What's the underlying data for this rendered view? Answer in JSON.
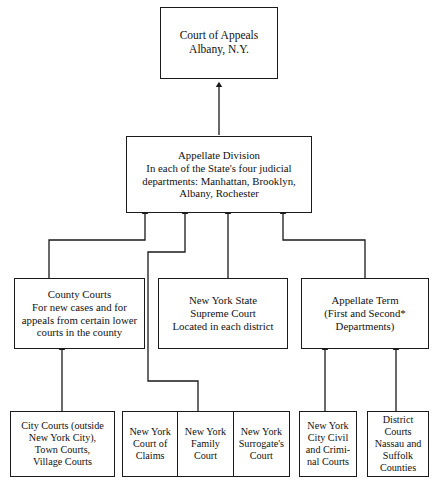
{
  "diagram": {
    "line_color": "#1a1a1a",
    "background": "#ffffff",
    "nodes": {
      "court_of_appeals": "Court of Appeals\nAlbany, N.Y.",
      "appellate_division": "Appellate Division\nIn each of the State's four judicial\ndepartments: Manhattan, Brooklyn,\nAlbany, Rochester",
      "county_courts": "County Courts\nFor new cases and for\nappeals from certain lower\ncourts in the county",
      "supreme_court": "New York State\nSupreme Court\nLocated in each district",
      "appellate_term": "Appellate Term\n(First and Second*\nDepartments)",
      "city_town_village_courts": "City Courts (outside\nNew York City),\nTown Courts,\nVillage Courts",
      "court_of_claims": "New York\nCourt of\nClaims",
      "family_court": "New York\nFamily\nCourt",
      "surrogates_court": "New York\nSurrogate's\nCourt",
      "nyc_civil_criminal_courts": "New York\nCity Civil\nand Crimi-\nnal Courts",
      "district_courts": "District\nCourts\nNassau and\nSuffolk\nCounties"
    }
  }
}
